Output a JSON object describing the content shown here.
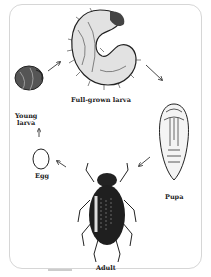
{
  "diagram": {
    "type": "life-cycle",
    "stages": [
      {
        "id": "egg",
        "label": "Egg"
      },
      {
        "id": "young-larva",
        "label": "Young larva"
      },
      {
        "id": "full-grown-larva",
        "label": "Full-grown larva"
      },
      {
        "id": "pupa",
        "label": "Pupa"
      },
      {
        "id": "adult",
        "label": "Adult"
      }
    ],
    "labels": {
      "young_larva_line1": "Young",
      "young_larva_line2": "larva",
      "full_grown_larva": "Full-grown larva",
      "pupa": "Pupa",
      "egg": "Egg",
      "adult": "Adult"
    },
    "flow": [
      "egg",
      "young-larva",
      "full-grown-larva",
      "pupa",
      "adult",
      "egg"
    ]
  }
}
